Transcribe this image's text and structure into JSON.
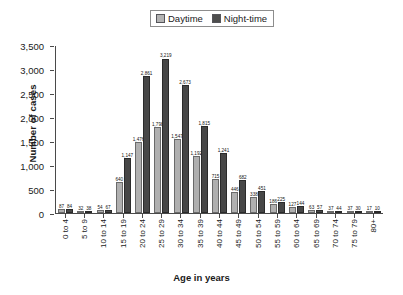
{
  "chart_data": {
    "type": "bar",
    "title": "",
    "xlabel": "Age in years",
    "ylabel": "Number of cases",
    "ylim": [
      0,
      3500
    ],
    "yticks": [
      "0",
      "500",
      "1,000",
      "1,500",
      "2,000",
      "2,500",
      "3,000",
      "3,500"
    ],
    "ytick_values": [
      0,
      500,
      1000,
      1500,
      2000,
      2500,
      3000,
      3500
    ],
    "grid": false,
    "legend_position": "top-center",
    "categories": [
      "0 to 4",
      "5 to 9",
      "10 to 14",
      "15 to 19",
      "20 to 24",
      "25 to 29",
      "30 to 34",
      "35 to 39",
      "40 to 44",
      "45 to 49",
      "50 to 54",
      "55 to 59",
      "60 to 64",
      "65 to 69",
      "70 to 74",
      "75 to 79",
      "80+"
    ],
    "series": [
      {
        "name": "Daytime",
        "color": "#b0b0b0",
        "values": [
          87,
          32,
          54,
          640,
          1476,
          1798,
          1547,
          1192,
          715,
          446,
          338,
          186,
          127,
          63,
          37,
          37,
          17
        ],
        "labels": [
          "87",
          "32",
          "54",
          "640",
          "1,476",
          "1,798",
          "1,547",
          "1,192",
          "715",
          "446",
          "338",
          "186",
          "127",
          "63",
          "37",
          "37",
          "17"
        ]
      },
      {
        "name": "Night-time",
        "color": "#474747",
        "values": [
          84,
          38,
          67,
          1147,
          2861,
          3219,
          2673,
          1815,
          1241,
          682,
          451,
          225,
          144,
          57,
          44,
          30,
          10
        ],
        "labels": [
          "84",
          "38",
          "67",
          "1,147",
          "2,861",
          "3,219",
          "2,673",
          "1,815",
          "1,241",
          "682",
          "451",
          "225",
          "144",
          "57",
          "44",
          "30",
          "10"
        ]
      }
    ]
  },
  "legend": {
    "daytime_label": "Daytime",
    "nighttime_label": "Night-time"
  }
}
